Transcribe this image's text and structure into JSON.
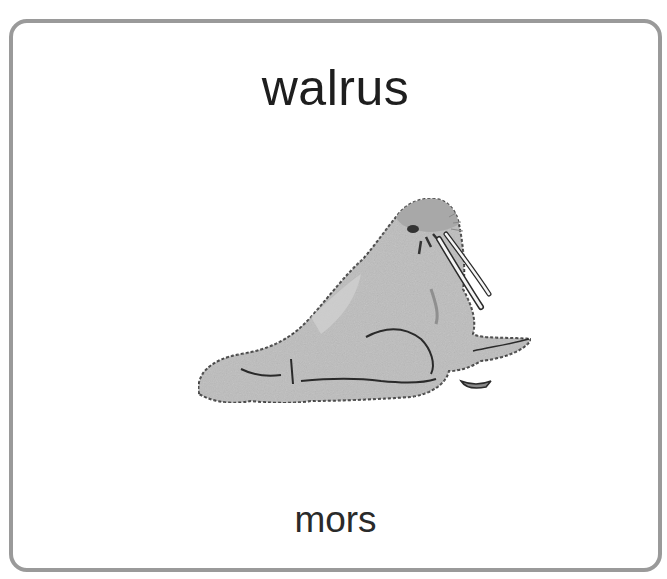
{
  "card": {
    "word": "walrus",
    "translation": "mors",
    "image": {
      "icon": "walrus-illustration",
      "description": "grayscale drawing of a walrus with tusks"
    },
    "colors": {
      "border": "#9a9a9a",
      "background": "#ffffff",
      "text": "#1e1e1e",
      "walrus_fill": "#b8b8b8",
      "walrus_outline": "#2a2a2a"
    }
  }
}
